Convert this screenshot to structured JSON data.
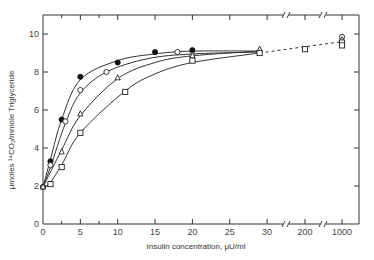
{
  "chart_data": {
    "type": "line",
    "title": "",
    "xlabel": "Insulin concentration, μU/ml",
    "ylabel": "μmoles ¹⁴CO₂/mmole Triglyceride",
    "ylim": [
      0,
      11
    ],
    "xlim": [
      0,
      30
    ],
    "x_break_ticks": [
      "200",
      "1000"
    ],
    "x_ticks": [
      "0",
      "5",
      "10",
      "15",
      "20",
      "25",
      "30",
      "200",
      "1000"
    ],
    "y_ticks": [
      "0",
      "2",
      "4",
      "6",
      "8",
      "10"
    ],
    "grid": false,
    "legend": "none",
    "series": [
      {
        "name": "filled-circle",
        "marker": "filled-circle",
        "points": [
          [
            0,
            1.95
          ],
          [
            1,
            3.3
          ],
          [
            2.5,
            5.5
          ],
          [
            5,
            7.75
          ],
          [
            10,
            8.5
          ],
          [
            15,
            9.05
          ],
          [
            20,
            9.15
          ]
        ]
      },
      {
        "name": "open-circle",
        "marker": "open-circle",
        "points": [
          [
            0,
            1.95
          ],
          [
            1,
            3.1
          ],
          [
            3,
            5.4
          ],
          [
            5,
            7.05
          ],
          [
            8.5,
            8.0
          ],
          [
            18,
            9.05
          ],
          [
            20,
            8.9
          ]
        ]
      },
      {
        "name": "open-triangle",
        "marker": "open-triangle",
        "points": [
          [
            0,
            1.95
          ],
          [
            2.5,
            3.8
          ],
          [
            5,
            5.8
          ],
          [
            10,
            7.7
          ],
          [
            20,
            8.85
          ],
          [
            29,
            9.2
          ]
        ]
      },
      {
        "name": "open-square",
        "marker": "open-square",
        "points": [
          [
            1,
            2.1
          ],
          [
            2.5,
            3.0
          ],
          [
            5,
            4.8
          ],
          [
            11,
            6.95
          ],
          [
            20,
            8.6
          ],
          [
            29,
            9.0
          ]
        ]
      }
    ],
    "high_dose_points": [
      {
        "x": "200",
        "marker": "open-square",
        "y": 9.2
      },
      {
        "x": "1000",
        "marker": "open-circle",
        "y": 9.85
      },
      {
        "x": "1000",
        "marker": "open-triangle",
        "y": 9.7
      },
      {
        "x": "1000",
        "marker": "open-square",
        "y": 9.55
      },
      {
        "x": "1000",
        "marker": "open-square",
        "y": 9.4
      }
    ],
    "dashed_extension": {
      "from_x": "30",
      "to_x": "1000",
      "y_start": 9.0,
      "y_end": 9.6
    }
  }
}
